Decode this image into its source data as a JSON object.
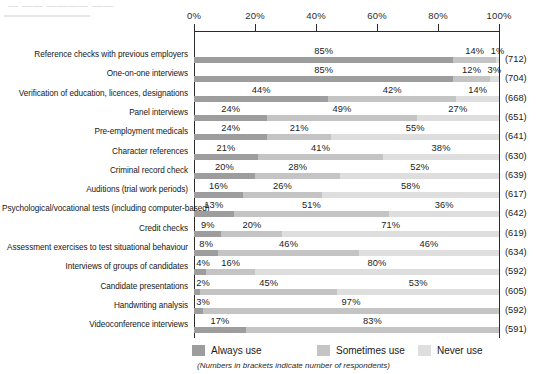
{
  "title_remnant": "—  ——  ————  ——",
  "axis": {
    "ticks": [
      "0%",
      "20%",
      "40%",
      "60%",
      "80%",
      "100%"
    ],
    "tick_values": [
      0,
      20,
      40,
      60,
      80,
      100
    ],
    "min": 0,
    "max": 100
  },
  "legend": {
    "position": "bottom",
    "items": [
      {
        "label": "Always use",
        "color": "#9d9d9d"
      },
      {
        "label": "Sometimes use",
        "color": "#c4c4c4"
      },
      {
        "label": "Never use",
        "color": "#dedede"
      }
    ]
  },
  "footnote": "(Numbers in brackets indicate number of respondents)",
  "chart_data": {
    "type": "bar",
    "orientation": "horizontal",
    "stacked": true,
    "normalized_percent": true,
    "title": "",
    "xlabel": "",
    "ylabel": "",
    "xlim": [
      0,
      100
    ],
    "grid": false,
    "legend_position": "bottom",
    "series": [
      {
        "name": "Always use",
        "color": "#9d9d9d",
        "values": [
          85,
          85,
          44,
          24,
          24,
          21,
          20,
          16,
          13,
          9,
          8,
          4,
          2,
          3,
          17
        ]
      },
      {
        "name": "Sometimes use",
        "color": "#c4c4c4",
        "values": [
          14,
          12,
          42,
          49,
          21,
          41,
          28,
          26,
          51,
          20,
          46,
          16,
          45,
          97,
          83
        ]
      },
      {
        "name": "Never use",
        "color": "#dedede",
        "values": [
          1,
          3,
          14,
          27,
          55,
          38,
          52,
          58,
          36,
          71,
          46,
          80,
          53,
          0,
          0
        ]
      }
    ],
    "categories": [
      "Reference checks with previous employers",
      "One-on-one interviews",
      "Verification of education, licences, designations",
      "Panel interviews",
      "Pre-employment medicals",
      "Character references",
      "Criminal record check",
      "Auditions (trial work periods)",
      "Psychological/vocational tests (including computer-based)",
      "Credit checks",
      "Assessment exercises to test situational behaviour",
      "Interviews of groups of candidates",
      "Candidate presentations",
      "Handwriting analysis",
      "Videoconference interviews"
    ],
    "respondents": [
      712,
      704,
      668,
      651,
      641,
      630,
      639,
      617,
      642,
      619,
      634,
      592,
      605,
      592,
      591
    ],
    "rows": [
      {
        "label": "Reference checks with previous employers",
        "count": "(712)",
        "segments": [
          {
            "series": "Always use",
            "value": 85,
            "data_label": "85%"
          },
          {
            "series": "Sometimes use",
            "value": 14,
            "data_label": "14%"
          },
          {
            "series": "Never use",
            "value": 1,
            "data_label": "1%"
          }
        ]
      },
      {
        "label": "One-on-one interviews",
        "count": "(704)",
        "segments": [
          {
            "series": "Always use",
            "value": 85,
            "data_label": "85%"
          },
          {
            "series": "Sometimes use",
            "value": 12,
            "data_label": "12%"
          },
          {
            "series": "Never use",
            "value": 3,
            "data_label": "3%"
          }
        ]
      },
      {
        "label": "Verification of education, licences, designations",
        "count": "(668)",
        "segments": [
          {
            "series": "Always use",
            "value": 44,
            "data_label": "44%"
          },
          {
            "series": "Sometimes use",
            "value": 42,
            "data_label": "42%"
          },
          {
            "series": "Never use",
            "value": 14,
            "data_label": "14%"
          }
        ]
      },
      {
        "label": "Panel interviews",
        "count": "(651)",
        "segments": [
          {
            "series": "Always use",
            "value": 24,
            "data_label": "24%"
          },
          {
            "series": "Sometimes use",
            "value": 49,
            "data_label": "49%"
          },
          {
            "series": "Never use",
            "value": 27,
            "data_label": "27%"
          }
        ]
      },
      {
        "label": "Pre-employment medicals",
        "count": "(641)",
        "segments": [
          {
            "series": "Always use",
            "value": 24,
            "data_label": "24%"
          },
          {
            "series": "Sometimes use",
            "value": 21,
            "data_label": "21%"
          },
          {
            "series": "Never use",
            "value": 55,
            "data_label": "55%"
          }
        ]
      },
      {
        "label": "Character references",
        "count": "(630)",
        "segments": [
          {
            "series": "Always use",
            "value": 21,
            "data_label": "21%"
          },
          {
            "series": "Sometimes use",
            "value": 41,
            "data_label": "41%"
          },
          {
            "series": "Never use",
            "value": 38,
            "data_label": "38%"
          }
        ]
      },
      {
        "label": "Criminal record check",
        "count": "(639)",
        "segments": [
          {
            "series": "Always use",
            "value": 20,
            "data_label": "20%"
          },
          {
            "series": "Sometimes use",
            "value": 28,
            "data_label": "28%"
          },
          {
            "series": "Never use",
            "value": 52,
            "data_label": "52%"
          }
        ]
      },
      {
        "label": "Auditions (trial work periods)",
        "count": "(617)",
        "segments": [
          {
            "series": "Always use",
            "value": 16,
            "data_label": "16%"
          },
          {
            "series": "Sometimes use",
            "value": 26,
            "data_label": "26%"
          },
          {
            "series": "Never use",
            "value": 58,
            "data_label": "58%"
          }
        ]
      },
      {
        "label": "Psychological/vocational tests (including computer-based)",
        "count": "(642)",
        "segments": [
          {
            "series": "Always use",
            "value": 13,
            "data_label": "13%"
          },
          {
            "series": "Sometimes use",
            "value": 51,
            "data_label": "51%"
          },
          {
            "series": "Never use",
            "value": 36,
            "data_label": "36%"
          }
        ]
      },
      {
        "label": "Credit checks",
        "count": "(619)",
        "segments": [
          {
            "series": "Always use",
            "value": 9,
            "data_label": "9%"
          },
          {
            "series": "Sometimes use",
            "value": 20,
            "data_label": "20%"
          },
          {
            "series": "Never use",
            "value": 71,
            "data_label": "71%"
          }
        ]
      },
      {
        "label": "Assessment exercises to test situational behaviour",
        "count": "(634)",
        "segments": [
          {
            "series": "Always use",
            "value": 8,
            "data_label": "8%"
          },
          {
            "series": "Sometimes use",
            "value": 46,
            "data_label": "46%"
          },
          {
            "series": "Never use",
            "value": 46,
            "data_label": "46%"
          }
        ]
      },
      {
        "label": "Interviews of groups of candidates",
        "count": "(592)",
        "segments": [
          {
            "series": "Always use",
            "value": 4,
            "data_label": "4%"
          },
          {
            "series": "Sometimes use",
            "value": 16,
            "data_label": "16%"
          },
          {
            "series": "Never use",
            "value": 80,
            "data_label": "80%"
          }
        ]
      },
      {
        "label": "Candidate presentations",
        "count": "(605)",
        "segments": [
          {
            "series": "Always use",
            "value": 2,
            "data_label": "2%"
          },
          {
            "series": "Sometimes use",
            "value": 45,
            "data_label": "45%"
          },
          {
            "series": "Never use",
            "value": 53,
            "data_label": "53%"
          }
        ]
      },
      {
        "label": "Handwriting analysis",
        "count": "(592)",
        "segments": [
          {
            "series": "Always use",
            "value": 3,
            "data_label": "3%"
          },
          {
            "series": "Sometimes use",
            "value": 97,
            "data_label": "97%"
          }
        ]
      },
      {
        "label": "Videoconference interviews",
        "count": "(591)",
        "segments": [
          {
            "series": "Always use",
            "value": 17,
            "data_label": "17%"
          },
          {
            "series": "Sometimes use",
            "value": 83,
            "data_label": "83%"
          }
        ]
      }
    ]
  }
}
